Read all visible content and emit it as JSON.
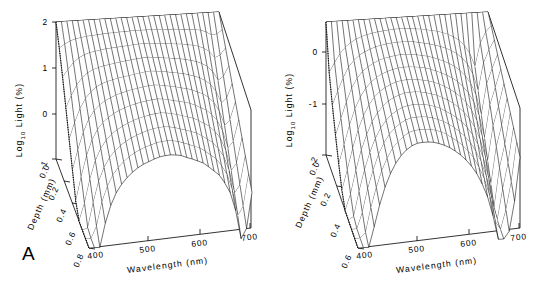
{
  "figure": {
    "background": "#ffffff",
    "line_color": "#000000",
    "type": "two-panel 3d mesh surface plot"
  },
  "panels": [
    {
      "id": "A",
      "letter": "A",
      "zaxis": {
        "label_main": "Log",
        "label_sub": "10",
        "label_rest": " Light  (%)",
        "ticks": [
          "2",
          "1",
          "0",
          "-1"
        ],
        "range": [
          -1,
          2
        ]
      },
      "depth_axis": {
        "label": "Depth  (mm)",
        "ticks": [
          "0.0",
          "0.2",
          "0.4",
          "0.6",
          "0.8"
        ],
        "range": [
          0.0,
          0.8
        ]
      },
      "wavelength_axis": {
        "label": "Wavelength  (nm)",
        "ticks": [
          "400",
          "500",
          "600",
          "700"
        ],
        "range": [
          400,
          700
        ]
      }
    },
    {
      "id": "B",
      "letter": "B",
      "zaxis": {
        "label_main": "Log",
        "label_sub": "10",
        "label_rest": " Light  (%)",
        "ticks": [
          "0",
          "-1",
          "-2"
        ],
        "range": [
          -2,
          0.5
        ]
      },
      "depth_axis": {
        "label": "Depth  (mm)",
        "ticks": [
          "0.0",
          "0.2",
          "0.4",
          "0.6"
        ],
        "range": [
          0.0,
          0.6
        ]
      },
      "wavelength_axis": {
        "label": "Wavelength  (nm)",
        "ticks": [
          "400",
          "500",
          "600",
          "700"
        ],
        "range": [
          400,
          700
        ]
      }
    }
  ],
  "chart_data": [
    {
      "type": "surface",
      "panel": "A",
      "title": "",
      "xlabel": "Wavelength (nm)",
      "ylabel": "Depth (mm)",
      "zlabel": "Log10 Light (%)",
      "xlim": [
        400,
        700
      ],
      "ylim": [
        0.0,
        0.8
      ],
      "zlim": [
        -1,
        2
      ],
      "grid": false,
      "legend": "none",
      "x": [
        400,
        410,
        420,
        430,
        440,
        450,
        460,
        470,
        480,
        490,
        500,
        510,
        520,
        530,
        540,
        550,
        560,
        570,
        580,
        590,
        600,
        610,
        620,
        630,
        640,
        650,
        660,
        670,
        680,
        690,
        700
      ],
      "y": [
        0.0,
        0.08,
        0.16,
        0.24,
        0.32,
        0.4,
        0.48,
        0.56,
        0.64,
        0.72,
        0.8
      ],
      "z": [
        [
          2.0,
          2.0,
          2.0,
          2.0,
          2.0,
          2.0,
          2.0,
          2.0,
          2.0,
          2.0,
          2.0,
          2.0,
          2.0,
          2.0,
          2.0,
          2.0,
          2.0,
          2.0,
          2.0,
          2.0,
          2.0,
          2.0,
          2.0,
          2.0,
          2.0,
          2.0,
          2.0,
          2.0,
          2.0,
          2.0,
          2.0
        ],
        [
          1.62,
          1.7,
          1.76,
          1.8,
          1.82,
          1.84,
          1.85,
          1.86,
          1.87,
          1.88,
          1.88,
          1.89,
          1.89,
          1.9,
          1.9,
          1.9,
          1.9,
          1.9,
          1.9,
          1.89,
          1.88,
          1.88,
          1.87,
          1.86,
          1.85,
          1.84,
          1.82,
          1.78,
          1.7,
          1.72,
          1.8
        ],
        [
          1.18,
          1.34,
          1.48,
          1.58,
          1.64,
          1.68,
          1.7,
          1.72,
          1.74,
          1.75,
          1.76,
          1.77,
          1.78,
          1.79,
          1.8,
          1.8,
          1.8,
          1.79,
          1.78,
          1.77,
          1.76,
          1.75,
          1.74,
          1.72,
          1.7,
          1.67,
          1.62,
          1.54,
          1.4,
          1.45,
          1.6
        ],
        [
          0.7,
          0.96,
          1.18,
          1.34,
          1.44,
          1.5,
          1.54,
          1.57,
          1.59,
          1.61,
          1.63,
          1.65,
          1.66,
          1.68,
          1.69,
          1.7,
          1.69,
          1.68,
          1.66,
          1.65,
          1.63,
          1.62,
          1.6,
          1.57,
          1.54,
          1.49,
          1.42,
          1.3,
          1.1,
          1.18,
          1.4
        ],
        [
          0.2,
          0.56,
          0.86,
          1.08,
          1.22,
          1.32,
          1.38,
          1.42,
          1.45,
          1.48,
          1.5,
          1.52,
          1.54,
          1.56,
          1.58,
          1.59,
          1.58,
          1.57,
          1.55,
          1.53,
          1.51,
          1.49,
          1.46,
          1.42,
          1.38,
          1.31,
          1.22,
          1.06,
          0.8,
          0.9,
          1.2
        ],
        [
          -0.28,
          0.16,
          0.54,
          0.82,
          1.0,
          1.12,
          1.2,
          1.26,
          1.31,
          1.35,
          1.38,
          1.41,
          1.43,
          1.45,
          1.47,
          1.48,
          1.47,
          1.45,
          1.43,
          1.41,
          1.38,
          1.36,
          1.32,
          1.27,
          1.22,
          1.14,
          1.02,
          0.82,
          0.5,
          0.62,
          1.0
        ],
        [
          -0.76,
          -0.24,
          0.22,
          0.56,
          0.78,
          0.93,
          1.03,
          1.11,
          1.17,
          1.22,
          1.26,
          1.29,
          1.32,
          1.34,
          1.36,
          1.37,
          1.36,
          1.34,
          1.31,
          1.29,
          1.26,
          1.23,
          1.18,
          1.12,
          1.06,
          0.96,
          0.82,
          0.58,
          0.2,
          0.34,
          0.8
        ],
        [
          -1.0,
          -0.62,
          -0.1,
          0.3,
          0.56,
          0.74,
          0.86,
          0.95,
          1.02,
          1.08,
          1.13,
          1.17,
          1.2,
          1.23,
          1.25,
          1.26,
          1.25,
          1.23,
          1.2,
          1.17,
          1.13,
          1.1,
          1.04,
          0.97,
          0.9,
          0.78,
          0.62,
          0.34,
          -0.1,
          0.06,
          0.6
        ],
        [
          -1.0,
          -0.96,
          -0.42,
          0.04,
          0.34,
          0.55,
          0.69,
          0.8,
          0.88,
          0.95,
          1.0,
          1.05,
          1.09,
          1.12,
          1.14,
          1.15,
          1.14,
          1.12,
          1.08,
          1.05,
          1.01,
          0.97,
          0.9,
          0.82,
          0.74,
          0.6,
          0.42,
          0.1,
          -0.4,
          -0.22,
          0.4
        ],
        [
          -1.0,
          -1.0,
          -0.74,
          -0.22,
          0.12,
          0.36,
          0.52,
          0.64,
          0.74,
          0.82,
          0.88,
          0.93,
          0.97,
          1.01,
          1.03,
          1.04,
          1.03,
          1.01,
          0.97,
          0.93,
          0.88,
          0.84,
          0.76,
          0.67,
          0.58,
          0.42,
          0.22,
          -0.14,
          -0.7,
          -0.5,
          0.2
        ],
        [
          -1.0,
          -1.0,
          -1.0,
          -0.48,
          -0.1,
          0.17,
          0.35,
          0.49,
          0.6,
          0.69,
          0.76,
          0.81,
          0.86,
          0.9,
          0.92,
          0.93,
          0.92,
          0.9,
          0.85,
          0.81,
          0.76,
          0.71,
          0.62,
          0.52,
          0.42,
          0.24,
          0.02,
          -0.38,
          -1.0,
          -0.78,
          0.0
        ]
      ],
      "description": "Log10 downwelling light (%) versus wavelength and depth; steep attenuation below 450 nm, broad plateau 500-650 nm, notch near 680 nm"
    },
    {
      "type": "surface",
      "panel": "B",
      "title": "",
      "xlabel": "Wavelength (nm)",
      "ylabel": "Depth (mm)",
      "zlabel": "Log10 Light (%)",
      "xlim": [
        400,
        700
      ],
      "ylim": [
        0.0,
        0.6
      ],
      "zlim": [
        -2,
        0.5
      ],
      "grid": false,
      "legend": "none",
      "x": [
        400,
        410,
        420,
        430,
        440,
        450,
        460,
        470,
        480,
        490,
        500,
        510,
        520,
        530,
        540,
        550,
        560,
        570,
        580,
        590,
        600,
        610,
        620,
        630,
        640,
        650,
        660,
        670,
        680,
        690,
        700
      ],
      "y": [
        0.0,
        0.06,
        0.12,
        0.18,
        0.24,
        0.3,
        0.36,
        0.42,
        0.48,
        0.54,
        0.6
      ],
      "z": [
        [
          0.5,
          0.5,
          0.5,
          0.5,
          0.5,
          0.5,
          0.5,
          0.5,
          0.5,
          0.5,
          0.5,
          0.5,
          0.5,
          0.5,
          0.5,
          0.5,
          0.5,
          0.5,
          0.5,
          0.5,
          0.5,
          0.5,
          0.5,
          0.5,
          0.5,
          0.5,
          0.5,
          0.5,
          0.5,
          0.5,
          0.5
        ],
        [
          -0.28,
          -0.1,
          0.06,
          0.18,
          0.26,
          0.32,
          0.36,
          0.39,
          0.41,
          0.43,
          0.44,
          0.45,
          0.46,
          0.46,
          0.46,
          0.45,
          0.44,
          0.43,
          0.41,
          0.39,
          0.37,
          0.34,
          0.3,
          0.25,
          0.18,
          0.08,
          -0.08,
          -0.34,
          0.1,
          0.3,
          0.42
        ],
        [
          -0.72,
          -0.46,
          -0.22,
          -0.02,
          0.1,
          0.19,
          0.25,
          0.29,
          0.33,
          0.35,
          0.37,
          0.38,
          0.39,
          0.39,
          0.39,
          0.38,
          0.36,
          0.34,
          0.32,
          0.29,
          0.26,
          0.22,
          0.17,
          0.11,
          0.02,
          -0.1,
          -0.3,
          -0.62,
          -0.1,
          0.14,
          0.32
        ],
        [
          -1.12,
          -0.8,
          -0.5,
          -0.24,
          -0.06,
          0.06,
          0.14,
          0.2,
          0.25,
          0.28,
          0.3,
          0.32,
          0.33,
          0.33,
          0.32,
          0.31,
          0.29,
          0.27,
          0.24,
          0.2,
          0.16,
          0.11,
          0.05,
          -0.03,
          -0.14,
          -0.29,
          -0.52,
          -0.9,
          -0.32,
          -0.04,
          0.22
        ],
        [
          -1.48,
          -1.12,
          -0.76,
          -0.46,
          -0.24,
          -0.08,
          0.03,
          0.11,
          0.17,
          0.21,
          0.24,
          0.26,
          0.27,
          0.27,
          0.26,
          0.25,
          0.23,
          0.2,
          0.16,
          0.12,
          0.07,
          0.01,
          -0.06,
          -0.16,
          -0.29,
          -0.47,
          -0.74,
          -1.16,
          -0.54,
          -0.22,
          0.12
        ],
        [
          -1.8,
          -1.42,
          -1.02,
          -0.68,
          -0.42,
          -0.22,
          -0.08,
          0.02,
          0.09,
          0.14,
          0.18,
          0.2,
          0.21,
          0.21,
          0.2,
          0.18,
          0.16,
          0.13,
          0.09,
          0.04,
          -0.02,
          -0.09,
          -0.18,
          -0.29,
          -0.44,
          -0.65,
          -0.96,
          -1.42,
          -0.76,
          -0.4,
          0.02
        ],
        [
          -2.0,
          -1.7,
          -1.26,
          -0.88,
          -0.6,
          -0.36,
          -0.2,
          -0.08,
          0.01,
          0.07,
          0.11,
          0.14,
          0.15,
          0.15,
          0.14,
          0.12,
          0.09,
          0.06,
          0.01,
          -0.04,
          -0.11,
          -0.19,
          -0.29,
          -0.42,
          -0.59,
          -0.83,
          -1.18,
          -1.68,
          -0.98,
          -0.58,
          -0.08
        ],
        [
          -2.0,
          -1.94,
          -1.48,
          -1.08,
          -0.76,
          -0.5,
          -0.31,
          -0.17,
          -0.07,
          0.0,
          0.05,
          0.08,
          0.09,
          0.09,
          0.08,
          0.06,
          0.03,
          -0.01,
          -0.07,
          -0.13,
          -0.2,
          -0.29,
          -0.4,
          -0.55,
          -0.74,
          -1.01,
          -1.4,
          -1.94,
          -1.2,
          -0.76,
          -0.18
        ],
        [
          -2.0,
          -2.0,
          -1.7,
          -1.26,
          -0.92,
          -0.63,
          -0.42,
          -0.26,
          -0.15,
          -0.07,
          -0.01,
          0.02,
          0.03,
          0.03,
          0.02,
          0.0,
          -0.04,
          -0.08,
          -0.14,
          -0.21,
          -0.29,
          -0.39,
          -0.51,
          -0.68,
          -0.89,
          -1.19,
          -1.62,
          -2.0,
          -1.42,
          -0.94,
          -0.28
        ],
        [
          -2.0,
          -2.0,
          -1.9,
          -1.44,
          -1.07,
          -0.76,
          -0.53,
          -0.35,
          -0.23,
          -0.14,
          -0.07,
          -0.04,
          -0.03,
          -0.03,
          -0.04,
          -0.06,
          -0.1,
          -0.15,
          -0.22,
          -0.29,
          -0.38,
          -0.49,
          -0.62,
          -0.81,
          -1.04,
          -1.37,
          -1.84,
          -2.0,
          -1.64,
          -1.12,
          -0.38
        ],
        [
          -2.0,
          -2.0,
          -2.0,
          -1.62,
          -1.22,
          -0.89,
          -0.64,
          -0.45,
          -0.31,
          -0.21,
          -0.14,
          -0.1,
          -0.09,
          -0.09,
          -0.1,
          -0.13,
          -0.17,
          -0.22,
          -0.29,
          -0.37,
          -0.47,
          -0.59,
          -0.74,
          -0.94,
          -1.19,
          -1.55,
          -2.0,
          -2.0,
          -1.86,
          -1.3,
          -0.48
        ]
      ],
      "description": "Log10 downwelling light (%) versus wavelength and depth with ridge near 520 nm and deep notch near 670-680 nm"
    }
  ]
}
